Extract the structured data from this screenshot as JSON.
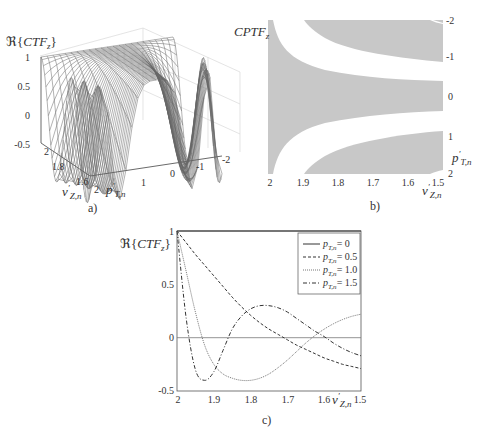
{
  "chart_data": [
    {
      "panel": "a",
      "type": "surface3d",
      "caption": "a)",
      "zlabel": "ℜ{CTF_z}",
      "zlabel_parts": {
        "prefix": "ℜ{",
        "main": "CTF",
        "sub": "z",
        "suffix": "}"
      },
      "xlabel": "v'_{Z,n}",
      "ylabel": "p'_{T,n}",
      "zticks": [
        "1",
        "0.5",
        "0",
        "-0.5"
      ],
      "xticks": [
        "2",
        "1.8",
        "1.6"
      ],
      "yticks": [
        "2",
        "1",
        "0",
        "-1",
        "-2"
      ],
      "zlim": [
        -0.5,
        1
      ],
      "xlim": [
        1.5,
        2
      ],
      "ylim": [
        -2,
        2
      ],
      "grid": true
    },
    {
      "panel": "b",
      "type": "heatmap",
      "caption": "b)",
      "title": "CPTF_z",
      "title_parts": {
        "main": "CPTF",
        "sub": "z"
      },
      "xlabel": "v'_{Z,n}",
      "ylabel": "p'_{T,n}",
      "xticks": [
        "2",
        "1.9",
        "1.8",
        "1.7",
        "1.6",
        "1.5"
      ],
      "yticks": [
        "-2",
        "-1",
        "0",
        "1",
        "2"
      ],
      "xlim": [
        2,
        1.5
      ],
      "ylim": [
        -2,
        2
      ],
      "colors": {
        "positive": "#c8c8c8",
        "negative": "#ffffff"
      },
      "description": "Binary sign map: gray where CTF is positive, white where negative; central gray band narrows from full height at v=2 to about |p|<0.45 at v=1.5, with outer gray bands curving toward |p|≈1.2-1.9"
    },
    {
      "panel": "c",
      "type": "line",
      "caption": "c)",
      "ylabel": "ℜ{CTF_z}",
      "ylabel_parts": {
        "prefix": "ℜ{",
        "main": "CTF",
        "sub": "z",
        "suffix": "}"
      },
      "xlabel": "v'_{Z,n}",
      "xticks": [
        "2",
        "1.9",
        "1.8",
        "1.7",
        "1.6",
        "1.5"
      ],
      "yticks": [
        "1",
        "0.5",
        "0",
        "-0.5"
      ],
      "xlim": [
        2,
        1.5
      ],
      "ylim": [
        -0.5,
        1
      ],
      "grid": false,
      "zero_line": true,
      "legend_position": "upper right",
      "x": [
        2.0,
        1.975,
        1.95,
        1.925,
        1.9,
        1.875,
        1.85,
        1.825,
        1.8,
        1.775,
        1.75,
        1.725,
        1.7,
        1.675,
        1.65,
        1.625,
        1.6,
        1.575,
        1.55,
        1.525,
        1.5
      ],
      "series": [
        {
          "name": "p'_{T,n}= 0",
          "label": "= 0",
          "style": "solid",
          "values": [
            1,
            1,
            1,
            1,
            1,
            1,
            1,
            1,
            1,
            1,
            1,
            1,
            1,
            1,
            1,
            1,
            1,
            1,
            1,
            1,
            1
          ]
        },
        {
          "name": "p'_{T,n}= 0.5",
          "label": "= 0.5",
          "style": "dashed",
          "values": [
            1.0,
            0.89,
            0.78,
            0.68,
            0.58,
            0.48,
            0.38,
            0.29,
            0.21,
            0.14,
            0.08,
            0.03,
            -0.02,
            -0.07,
            -0.11,
            -0.15,
            -0.19,
            -0.22,
            -0.25,
            -0.27,
            -0.29
          ]
        },
        {
          "name": "p'_{T,n}= 1.0",
          "label": "= 1.0",
          "style": "dotted",
          "values": [
            1.0,
            0.62,
            0.24,
            -0.07,
            -0.25,
            -0.34,
            -0.38,
            -0.4,
            -0.4,
            -0.38,
            -0.34,
            -0.28,
            -0.21,
            -0.13,
            -0.05,
            0.02,
            0.08,
            0.13,
            0.17,
            0.2,
            0.22
          ]
        },
        {
          "name": "p'_{T,n}= 1.5",
          "label": "= 1.5",
          "style": "dashdot",
          "values": [
            1.0,
            0.18,
            -0.3,
            -0.4,
            -0.32,
            -0.12,
            0.08,
            0.2,
            0.27,
            0.3,
            0.3,
            0.28,
            0.24,
            0.18,
            0.12,
            0.06,
            0.01,
            -0.05,
            -0.1,
            -0.14,
            -0.17
          ]
        }
      ]
    }
  ]
}
